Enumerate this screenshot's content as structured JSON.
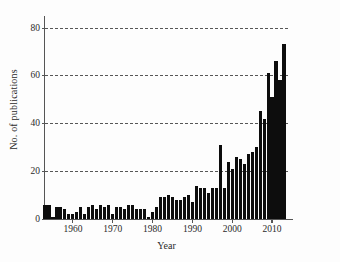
{
  "chart_data": {
    "type": "bar",
    "title": "",
    "subtitle": "",
    "xlabel": "Year",
    "ylabel": "No. of publications",
    "xlim": [
      1953,
      2014
    ],
    "ylim": [
      0,
      84
    ],
    "grid": true,
    "legend": null,
    "bar_color": "#0d0d0d",
    "xticks": [
      1960,
      1970,
      1980,
      1990,
      2000,
      2010
    ],
    "xtick_labels": [
      "1960",
      "1970",
      "1980",
      "1990",
      "2000",
      "2010"
    ],
    "yticks": [
      0,
      20,
      40,
      60,
      80
    ],
    "ytick_labels": [
      "0",
      "20",
      "40",
      "60",
      "80"
    ],
    "categories": [
      1953,
      1954,
      1955,
      1956,
      1957,
      1958,
      1959,
      1960,
      1961,
      1962,
      1963,
      1964,
      1965,
      1966,
      1967,
      1968,
      1969,
      1970,
      1971,
      1972,
      1973,
      1974,
      1975,
      1976,
      1977,
      1978,
      1979,
      1980,
      1981,
      1982,
      1983,
      1984,
      1985,
      1986,
      1987,
      1988,
      1989,
      1990,
      1991,
      1992,
      1993,
      1994,
      1995,
      1996,
      1997,
      1998,
      1999,
      2000,
      2001,
      2002,
      2003,
      2004,
      2005,
      2006,
      2007,
      2008,
      2009,
      2010,
      2011,
      2012,
      2013
    ],
    "values": [
      6,
      6,
      1,
      5,
      5,
      4,
      2,
      2,
      3,
      5,
      2,
      5,
      6,
      4,
      6,
      5,
      6,
      2,
      5,
      5,
      4,
      6,
      6,
      4,
      4,
      4,
      1,
      3,
      5,
      9,
      9,
      10,
      9,
      8,
      8,
      9,
      10,
      7,
      14,
      13,
      13,
      11,
      13,
      13,
      31,
      13,
      24,
      21,
      26,
      25,
      23,
      27,
      28,
      30,
      45,
      42,
      61,
      51,
      66,
      58,
      73
    ]
  }
}
